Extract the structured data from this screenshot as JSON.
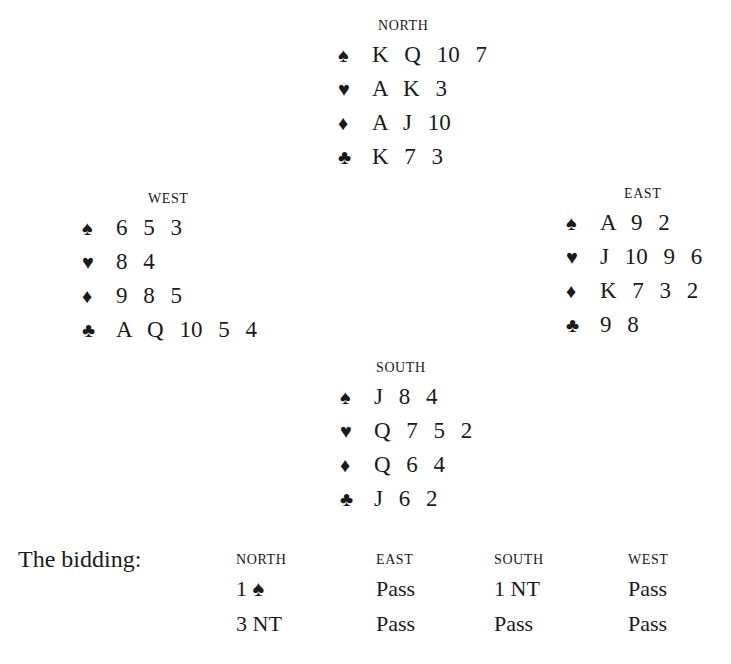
{
  "hands": {
    "north": {
      "title": "NORTH",
      "spades": "K Q 10 7",
      "hearts": "A K 3",
      "diamonds": "A J 10",
      "clubs": "K 7 3"
    },
    "west": {
      "title": "WEST",
      "spades": "6 5 3",
      "hearts": "8 4",
      "diamonds": "9 8 5",
      "clubs": "A Q 10 5 4"
    },
    "east": {
      "title": "EAST",
      "spades": "A 9 2",
      "hearts": "J 10 9 6",
      "diamonds": "K 7 3 2",
      "clubs": "9 8"
    },
    "south": {
      "title": "SOUTH",
      "spades": "J 8 4",
      "hearts": "Q 7 5 2",
      "diamonds": "Q 6 4",
      "clubs": "J 6 2"
    }
  },
  "suit_icons": {
    "spades": "♠",
    "hearts": "♥",
    "diamonds": "♦",
    "clubs": "♣"
  },
  "bidding": {
    "label": "The bidding:",
    "columns": [
      {
        "header": "NORTH",
        "bids": [
          "1 ♠",
          "3 NT"
        ]
      },
      {
        "header": "EAST",
        "bids": [
          "Pass",
          "Pass"
        ]
      },
      {
        "header": "SOUTH",
        "bids": [
          "1 NT",
          "Pass"
        ]
      },
      {
        "header": "WEST",
        "bids": [
          "Pass",
          "Pass"
        ]
      }
    ]
  }
}
